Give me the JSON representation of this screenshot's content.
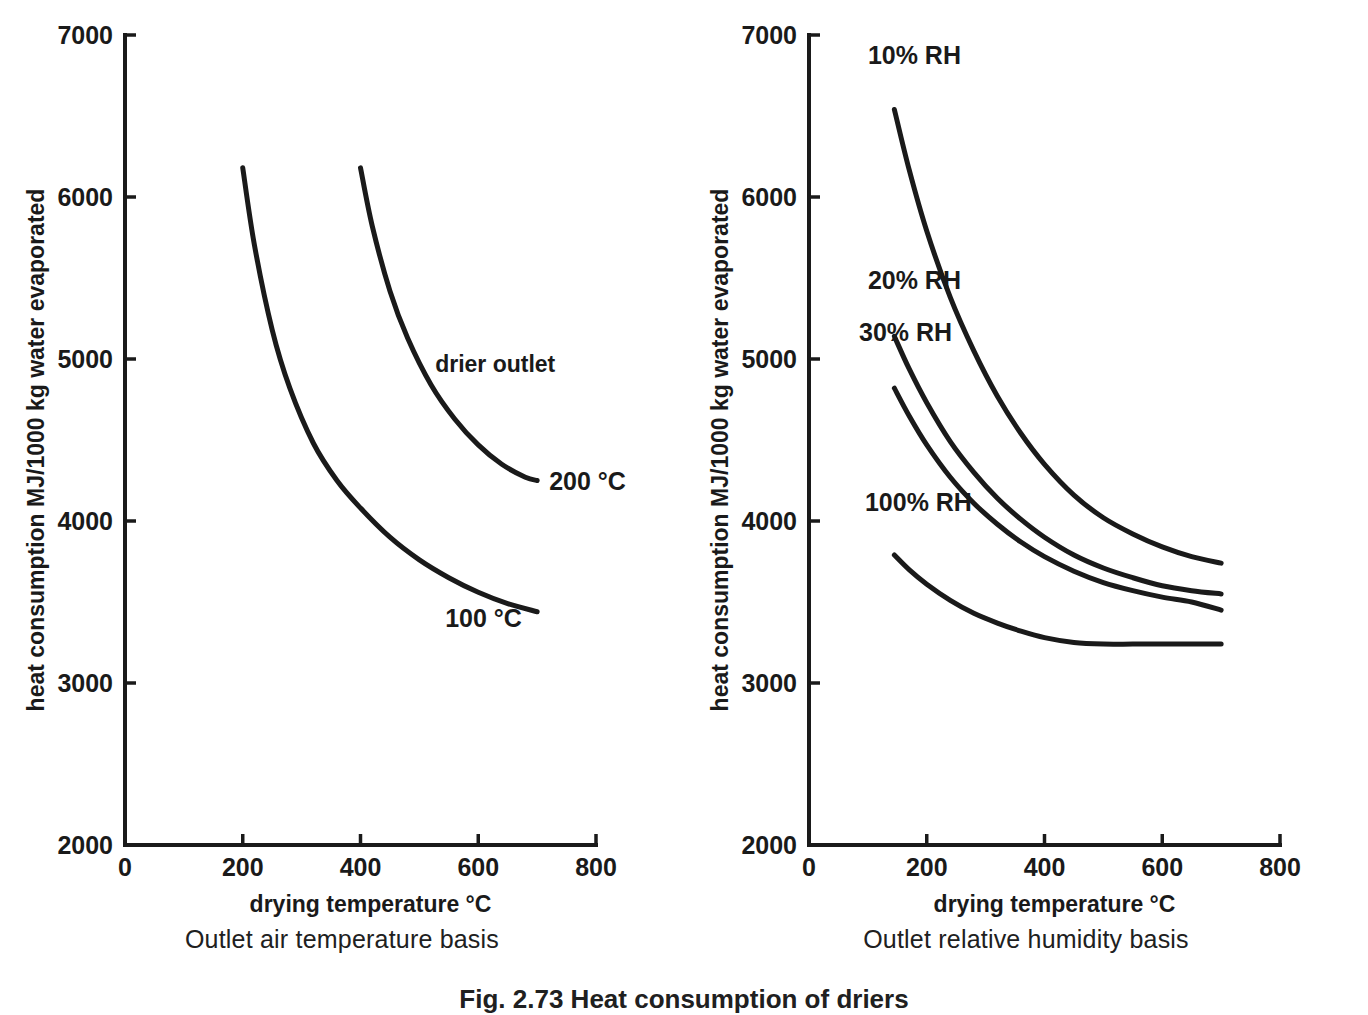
{
  "figure": {
    "caption": "Fig. 2.73 Heat consumption of driers",
    "panels": [
      {
        "subtitle": "Outlet air temperature basis",
        "annotation": "drier outlet",
        "xlabel": "drying temperature  °C",
        "ylabel": "heat consumption MJ/1000 kg water evaporated",
        "xticks": [
          "0",
          "200",
          "400",
          "600",
          "800"
        ],
        "yticks": [
          "2000",
          "3000",
          "4000",
          "5000",
          "6000",
          "7000"
        ]
      },
      {
        "subtitle": "Outlet relative humidity basis",
        "xlabel": "drying temperature  °C",
        "ylabel": "heat consumption MJ/1000 kg water evaporated",
        "xticks": [
          "0",
          "200",
          "400",
          "600",
          "800"
        ],
        "yticks": [
          "2000",
          "3000",
          "4000",
          "5000",
          "6000",
          "7000"
        ]
      }
    ]
  },
  "chart_data": [
    {
      "type": "line",
      "title": "Outlet air temperature basis",
      "xlabel": "drying temperature  °C",
      "ylabel": "heat consumption MJ/1000 kg water evaporated",
      "xlim": [
        0,
        800
      ],
      "ylim": [
        2000,
        7000
      ],
      "xticks": [
        0,
        200,
        400,
        600,
        800
      ],
      "yticks": [
        2000,
        3000,
        4000,
        5000,
        6000,
        7000
      ],
      "grid": false,
      "legend": "inline-curve-labels",
      "annotations": [
        "drier outlet"
      ],
      "series": [
        {
          "name": "100 °C",
          "label": "100 °C",
          "x": [
            200,
            220,
            250,
            280,
            320,
            360,
            400,
            450,
            500,
            550,
            600,
            650,
            700
          ],
          "y": [
            6180,
            5700,
            5180,
            4820,
            4480,
            4250,
            4080,
            3900,
            3760,
            3650,
            3560,
            3490,
            3440
          ]
        },
        {
          "name": "200 °C",
          "label": "200 °C",
          "x": [
            400,
            420,
            450,
            480,
            520,
            560,
            600,
            640,
            680,
            700
          ],
          "y": [
            6180,
            5820,
            5420,
            5130,
            4840,
            4630,
            4470,
            4350,
            4270,
            4250
          ]
        }
      ]
    },
    {
      "type": "line",
      "title": "Outlet relative humidity basis",
      "xlabel": "drying temperature  °C",
      "ylabel": "heat consumption MJ/1000 kg water evaporated",
      "xlim": [
        0,
        800
      ],
      "ylim": [
        2000,
        7000
      ],
      "xticks": [
        0,
        200,
        400,
        600,
        800
      ],
      "yticks": [
        2000,
        3000,
        4000,
        5000,
        6000,
        7000
      ],
      "grid": false,
      "legend": "inline-curve-labels",
      "series": [
        {
          "name": "10% RH",
          "label": "10% RH",
          "x": [
            145,
            170,
            200,
            240,
            280,
            320,
            360,
            400,
            450,
            500,
            550,
            600,
            650,
            700
          ],
          "y": [
            6540,
            6170,
            5790,
            5380,
            5050,
            4770,
            4540,
            4350,
            4160,
            4020,
            3920,
            3840,
            3780,
            3740
          ]
        },
        {
          "name": "20% RH",
          "label": "20% RH",
          "x": [
            145,
            170,
            200,
            240,
            280,
            320,
            360,
            400,
            450,
            500,
            550,
            600,
            650,
            700
          ],
          "y": [
            5140,
            4940,
            4730,
            4490,
            4300,
            4140,
            4010,
            3900,
            3790,
            3710,
            3650,
            3600,
            3570,
            3550
          ]
        },
        {
          "name": "30% RH",
          "label": "30% RH",
          "x": [
            145,
            170,
            200,
            240,
            280,
            320,
            360,
            400,
            450,
            500,
            550,
            600,
            650,
            700
          ],
          "y": [
            4820,
            4650,
            4470,
            4270,
            4110,
            3980,
            3870,
            3780,
            3690,
            3620,
            3570,
            3530,
            3500,
            3450
          ]
        },
        {
          "name": "100% RH",
          "label": "100% RH",
          "x": [
            145,
            170,
            200,
            240,
            280,
            320,
            360,
            400,
            450,
            500,
            550,
            600,
            650,
            700
          ],
          "y": [
            3790,
            3700,
            3610,
            3510,
            3430,
            3370,
            3320,
            3280,
            3250,
            3240,
            3240,
            3240,
            3240,
            3240
          ]
        }
      ]
    }
  ]
}
